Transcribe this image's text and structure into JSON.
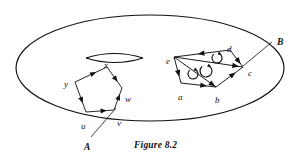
{
  "figure": {
    "caption": "Figure 8.2",
    "caption_x": 134,
    "caption_y": 140,
    "background_color": "#ffffff",
    "ink_color": "#101010",
    "type": "topology-diagram",
    "description_regions": [
      "A",
      "B"
    ]
  },
  "surface": {
    "name": "outer-ellipse",
    "cx": 150,
    "cy": 68,
    "rx": 134,
    "ry": 53,
    "stroke": "#101010",
    "stroke_width": 1.15
  },
  "lens": {
    "name": "lens-shape",
    "left_x": 86,
    "right_x": 143,
    "y": 58,
    "bulge": 9,
    "vertex_label": "x"
  },
  "region_a": {
    "label": "A",
    "label_x": 84,
    "label_y": 143,
    "leader": {
      "x1": 91,
      "y1": 137,
      "x2": 116,
      "y2": 108
    },
    "polygon_name": "pentagon-xyuvw",
    "vertices": [
      {
        "id": "x",
        "label": "x",
        "x": 107,
        "y": 67,
        "label_x": 104,
        "label_y": 61
      },
      {
        "id": "y",
        "label": "y",
        "x": 75,
        "y": 82,
        "label_x": 64,
        "label_y": 80
      },
      {
        "id": "u",
        "label": "u",
        "x": 86,
        "y": 112,
        "label_x": 81,
        "label_y": 122
      },
      {
        "id": "v",
        "label": "v",
        "x": 114,
        "y": 110,
        "label_x": 117,
        "label_y": 119
      },
      {
        "id": "w",
        "label": "w",
        "x": 122,
        "y": 88,
        "label_x": 125,
        "label_y": 95
      }
    ],
    "edges": [
      {
        "from": "y",
        "to": "x",
        "arrow_at": 0.55
      },
      {
        "from": "x",
        "to": "w",
        "arrow_at": 0.55
      },
      {
        "from": "y",
        "to": "u",
        "arrow_at": 0.58
      },
      {
        "from": "u",
        "to": "v",
        "arrow_at": 0.6
      },
      {
        "from": "v",
        "to": "w",
        "arrow_at": 0.55
      }
    ]
  },
  "region_b": {
    "label": "B",
    "label_x": 277,
    "label_y": 38,
    "leader": {
      "x1": 272,
      "y1": 42,
      "x2": 243,
      "y2": 66
    },
    "polygon_name": "triangulated-polygon-abcde",
    "vertices": [
      {
        "id": "e",
        "label": "e",
        "x": 174,
        "y": 57,
        "label_x": 166,
        "label_y": 57
      },
      {
        "id": "d",
        "label": "d",
        "x": 230,
        "y": 50,
        "label_x": 227,
        "label_y": 45
      },
      {
        "id": "c",
        "label": "c",
        "x": 243,
        "y": 67,
        "label_x": 248,
        "label_y": 69
      },
      {
        "id": "b",
        "label": "b",
        "x": 216,
        "y": 87,
        "label_x": 215,
        "label_y": 96
      },
      {
        "id": "a",
        "label": "a",
        "x": 181,
        "y": 83,
        "label_x": 178,
        "label_y": 93
      }
    ],
    "edges": [
      {
        "from": "d",
        "to": "e",
        "arrow_at": 0.5
      },
      {
        "from": "d",
        "to": "c",
        "arrow_at": 0.62
      },
      {
        "from": "e",
        "to": "c",
        "arrow_at": 0.88
      },
      {
        "from": "e",
        "to": "a",
        "arrow_at": 0.6
      },
      {
        "from": "a",
        "to": "b",
        "arrow_at": 0.62
      },
      {
        "from": "e",
        "to": "b",
        "arrow_at": 0.9
      },
      {
        "from": "b",
        "to": "c",
        "arrow_at": 0.6
      }
    ],
    "orientation_marks": [
      {
        "name": "orientation-arrow-edc",
        "cx": 217,
        "cy": 58,
        "r": 5
      },
      {
        "name": "orientation-arrow-ebc",
        "cx": 206,
        "cy": 71,
        "r": 6
      },
      {
        "name": "orientation-arrow-eab",
        "cx": 193,
        "cy": 74,
        "r": 5
      }
    ]
  }
}
